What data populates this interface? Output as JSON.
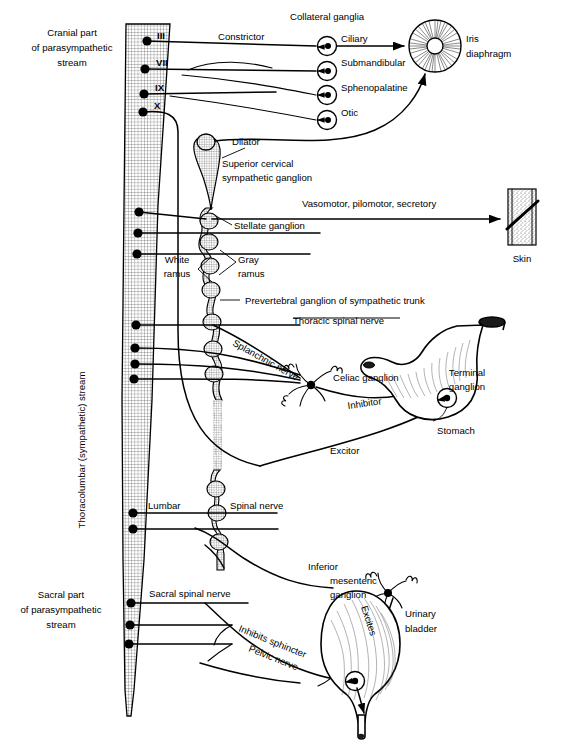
{
  "figure": {
    "ink_color": "#000000",
    "background_color": "#ffffff"
  },
  "streams": {
    "cranial": {
      "line1": "Cranial part",
      "line2": "of parasympathetic",
      "line3": "stream"
    },
    "thoracolumbar": {
      "label": "Thoracolumbar (sympathetic) stream"
    },
    "sacral": {
      "line1": "Sacral part",
      "line2": "of parasympathetic",
      "line3": "stream"
    }
  },
  "cranial_nerves": [
    {
      "roman": "III",
      "y": 41
    },
    {
      "roman": "VII",
      "y": 69
    },
    {
      "roman": "IX",
      "y": 94
    },
    {
      "roman": "X",
      "y": 112
    }
  ],
  "collateral": {
    "heading": "Collateral ganglia",
    "ganglia": [
      {
        "name": "Ciliary",
        "cx": 327,
        "cy": 46
      },
      {
        "name": "Submandibular",
        "cx": 327,
        "cy": 71
      },
      {
        "name": "Sphenopalatine",
        "cx": 327,
        "cy": 95
      },
      {
        "name": "Otic",
        "cx": 327,
        "cy": 120
      }
    ]
  },
  "labels": {
    "constrictor": "Constrictor",
    "dilator": "Dilator",
    "iris_line1": "Iris",
    "iris_line2": "diaphragm",
    "superior_cervical_line1": "Superior cervical",
    "superior_cervical_line2": "sympathetic ganglion",
    "vasomotor": "Vasomotor, pilomotor, secretory",
    "skin": "Skin",
    "stellate": "Stellate ganglion",
    "white_ramus_line1": "White",
    "white_ramus_line2": "ramus",
    "gray_ramus_line1": "Gray",
    "gray_ramus_line2": "ramus",
    "prevertebral": "Prevertebral ganglion of sympathetic trunk",
    "thoracic_spinal_nerve": "Thoracic spinal nerve",
    "splanchnic": "Splanchnic nerve",
    "celiac": "Celiac ganglion",
    "inhibitor": "Inhibitor",
    "excitor": "Excitor",
    "terminal_line1": "Terminal",
    "terminal_line2": "ganglion",
    "stomach": "Stomach",
    "lumbar": "Lumbar",
    "spinal_nerve": "Spinal nerve",
    "sacral_spinal_nerve": "Sacral spinal nerve",
    "inferior_mes_line1": "Inferior",
    "inferior_mes_line2": "mesenteric",
    "inferior_mes_line3": "ganglion",
    "inhibits_sphincter": "Inhibits sphincter",
    "pelvic_nerve": "Pelvic nerve",
    "excites": "Excites",
    "urinary_line1": "Urinary",
    "urinary_line2": "bladder"
  },
  "icons": {
    "cord": "spinal-cord-shape",
    "iris": "iris-diaphragm-icon",
    "skin": "skin-patch-icon",
    "stomach": "stomach-icon",
    "bladder": "urinary-bladder-icon",
    "ganglion": "ganglion-circle-icon",
    "sympathetic_trunk": "sympathetic-trunk-chain-icon"
  }
}
